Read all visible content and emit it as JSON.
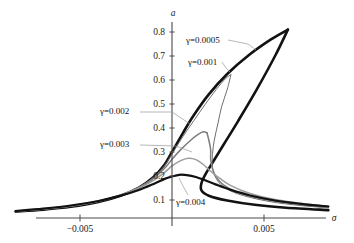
{
  "figure": {
    "background": "#ffffff",
    "axis_color": "#4a4a4a",
    "xlabel": "σ",
    "ylabel": "a"
  },
  "chart_data": {
    "type": "line",
    "title": "",
    "xlabel": "σ",
    "ylabel": "a",
    "xlim": [
      -0.0085,
      0.0085
    ],
    "ylim": [
      0.0,
      0.86
    ],
    "xticks": [
      -0.005,
      0.005
    ],
    "xticklabels": [
      "−0.005",
      "0.005"
    ],
    "yticks": [
      0.1,
      0.2,
      0.3,
      0.4,
      0.5,
      0.6,
      0.7,
      0.8
    ],
    "yticklabels": [
      "0.1",
      "0.2",
      "0.3",
      "0.4",
      "0.5",
      "0.6",
      "0.7",
      "0.8"
    ],
    "grid": false,
    "legend_position": "inline-annotations",
    "series": [
      {
        "name": "γ=0.0005",
        "gamma": 0.0005,
        "color": "#121212",
        "width": 2.6,
        "peak_amplitude": 0.81,
        "points": [
          [
            -0.0085,
            0.052
          ],
          [
            -0.007,
            0.06
          ],
          [
            -0.0055,
            0.072
          ],
          [
            -0.004,
            0.092
          ],
          [
            -0.0028,
            0.118
          ],
          [
            -0.0018,
            0.152
          ],
          [
            -0.001,
            0.196
          ],
          [
            -0.0004,
            0.248
          ],
          [
            0.0,
            0.3
          ],
          [
            0.0006,
            0.38
          ],
          [
            0.0012,
            0.455
          ],
          [
            0.002,
            0.54
          ],
          [
            0.003,
            0.625
          ],
          [
            0.0042,
            0.705
          ],
          [
            0.0054,
            0.77
          ],
          [
            0.0063,
            0.81
          ]
        ],
        "lower_branch": [
          [
            0.0063,
            0.81
          ],
          [
            0.0056,
            0.7
          ],
          [
            0.0046,
            0.56
          ],
          [
            0.0036,
            0.43
          ],
          [
            0.0028,
            0.33
          ],
          [
            0.0022,
            0.255
          ],
          [
            0.0018,
            0.205
          ],
          [
            0.0016,
            0.17
          ],
          [
            0.0016,
            0.14
          ],
          [
            0.002,
            0.118
          ],
          [
            0.003,
            0.098
          ],
          [
            0.0045,
            0.08
          ],
          [
            0.0062,
            0.068
          ],
          [
            0.0085,
            0.058
          ]
        ]
      },
      {
        "name": "γ=0.001",
        "gamma": 0.001,
        "color": "#6e6e6e",
        "width": 1.0,
        "peak_amplitude": 0.62,
        "points": [
          [
            -0.0085,
            0.052
          ],
          [
            -0.007,
            0.061
          ],
          [
            -0.0055,
            0.073
          ],
          [
            -0.004,
            0.093
          ],
          [
            -0.0028,
            0.119
          ],
          [
            -0.0018,
            0.152
          ],
          [
            -0.001,
            0.195
          ],
          [
            -0.0004,
            0.244
          ],
          [
            0.0,
            0.292
          ],
          [
            0.0006,
            0.365
          ],
          [
            0.0012,
            0.432
          ],
          [
            0.0018,
            0.498
          ],
          [
            0.0024,
            0.56
          ],
          [
            0.0029,
            0.605
          ],
          [
            0.0032,
            0.622
          ]
        ],
        "lower_branch": [
          [
            0.0032,
            0.622
          ],
          [
            0.003,
            0.56
          ],
          [
            0.0027,
            0.49
          ],
          [
            0.0025,
            0.42
          ],
          [
            0.0023,
            0.35
          ],
          [
            0.0022,
            0.29
          ],
          [
            0.0022,
            0.235
          ],
          [
            0.0024,
            0.19
          ],
          [
            0.0028,
            0.155
          ],
          [
            0.0036,
            0.125
          ],
          [
            0.005,
            0.098
          ],
          [
            0.0066,
            0.08
          ],
          [
            0.0085,
            0.067
          ]
        ]
      },
      {
        "name": "γ=0.002",
        "gamma": 0.002,
        "color": "#7d7d7d",
        "width": 1.5,
        "peak_amplitude": 0.385,
        "points": [
          [
            -0.0085,
            0.052
          ],
          [
            -0.007,
            0.062
          ],
          [
            -0.0055,
            0.075
          ],
          [
            -0.004,
            0.095
          ],
          [
            -0.0028,
            0.12
          ],
          [
            -0.0018,
            0.152
          ],
          [
            -0.001,
            0.19
          ],
          [
            -0.0004,
            0.232
          ],
          [
            0.0,
            0.27
          ],
          [
            0.0005,
            0.312
          ],
          [
            0.001,
            0.348
          ],
          [
            0.0014,
            0.372
          ],
          [
            0.0017,
            0.384
          ],
          [
            0.0019,
            0.38
          ]
        ],
        "lower_branch": [
          [
            0.0019,
            0.38
          ],
          [
            0.002,
            0.35
          ],
          [
            0.0021,
            0.31
          ],
          [
            0.0021,
            0.27
          ],
          [
            0.0022,
            0.23
          ],
          [
            0.0024,
            0.195
          ],
          [
            0.0028,
            0.163
          ],
          [
            0.0035,
            0.134
          ],
          [
            0.0048,
            0.106
          ],
          [
            0.0064,
            0.086
          ],
          [
            0.0085,
            0.07
          ]
        ]
      },
      {
        "name": "γ=0.003",
        "gamma": 0.003,
        "color": "#9c9c9c",
        "width": 1.5,
        "peak_amplitude": 0.275,
        "points": [
          [
            -0.0085,
            0.053
          ],
          [
            -0.007,
            0.063
          ],
          [
            -0.0055,
            0.076
          ],
          [
            -0.004,
            0.096
          ],
          [
            -0.0028,
            0.12
          ],
          [
            -0.0018,
            0.149
          ],
          [
            -0.001,
            0.182
          ],
          [
            -0.0004,
            0.215
          ],
          [
            0.0,
            0.242
          ],
          [
            0.0005,
            0.265
          ],
          [
            0.0009,
            0.274
          ],
          [
            0.0013,
            0.268
          ],
          [
            0.0017,
            0.248
          ],
          [
            0.0021,
            0.22
          ],
          [
            0.0026,
            0.19
          ],
          [
            0.0032,
            0.16
          ],
          [
            0.0042,
            0.128
          ],
          [
            0.0056,
            0.102
          ],
          [
            0.007,
            0.086
          ],
          [
            0.0085,
            0.074
          ]
        ],
        "lower_branch": []
      },
      {
        "name": "γ=0.004",
        "gamma": 0.004,
        "color": "#111111",
        "width": 2.2,
        "peak_amplitude": 0.205,
        "points": [
          [
            -0.0085,
            0.054
          ],
          [
            -0.007,
            0.064
          ],
          [
            -0.0055,
            0.077
          ],
          [
            -0.004,
            0.096
          ],
          [
            -0.0028,
            0.118
          ],
          [
            -0.0018,
            0.142
          ],
          [
            -0.001,
            0.167
          ],
          [
            -0.0004,
            0.188
          ],
          [
            0.0,
            0.198
          ],
          [
            0.0004,
            0.205
          ],
          [
            0.0008,
            0.204
          ],
          [
            0.0013,
            0.196
          ],
          [
            0.0018,
            0.182
          ],
          [
            0.0024,
            0.164
          ],
          [
            0.0032,
            0.142
          ],
          [
            0.0042,
            0.12
          ],
          [
            0.0056,
            0.098
          ],
          [
            0.007,
            0.084
          ],
          [
            0.0085,
            0.073
          ]
        ],
        "lower_branch": []
      }
    ],
    "annotations": [
      {
        "id": "ann-g0005",
        "text": "γ=0.0005",
        "x_px": 186,
        "y_px": 36,
        "leader": [
          [
            228,
            40
          ],
          [
            248,
            44
          ],
          [
            256,
            50
          ]
        ]
      },
      {
        "id": "ann-g001",
        "text": "γ=0.001",
        "x_px": 188,
        "y_px": 58,
        "leader": [
          [
            222,
            62
          ],
          [
            226,
            68
          ],
          [
            230,
            72
          ]
        ]
      },
      {
        "id": "ann-g002",
        "text": "γ=0.002",
        "x_px": 100,
        "y_px": 107,
        "leader": [
          [
            140,
            112
          ],
          [
            172,
            112
          ],
          [
            190,
            124
          ]
        ]
      },
      {
        "id": "ann-g003",
        "text": "γ=0.003",
        "x_px": 100,
        "y_px": 140,
        "leader": [
          [
            140,
            145
          ],
          [
            176,
            146
          ],
          [
            192,
            152
          ]
        ]
      },
      {
        "id": "ann-g004",
        "text": "γ=0.004",
        "x_px": 176,
        "y_px": 198,
        "leader": [
          [
            188,
            195
          ],
          [
            183,
            186
          ],
          [
            179,
            178
          ]
        ]
      }
    ]
  }
}
